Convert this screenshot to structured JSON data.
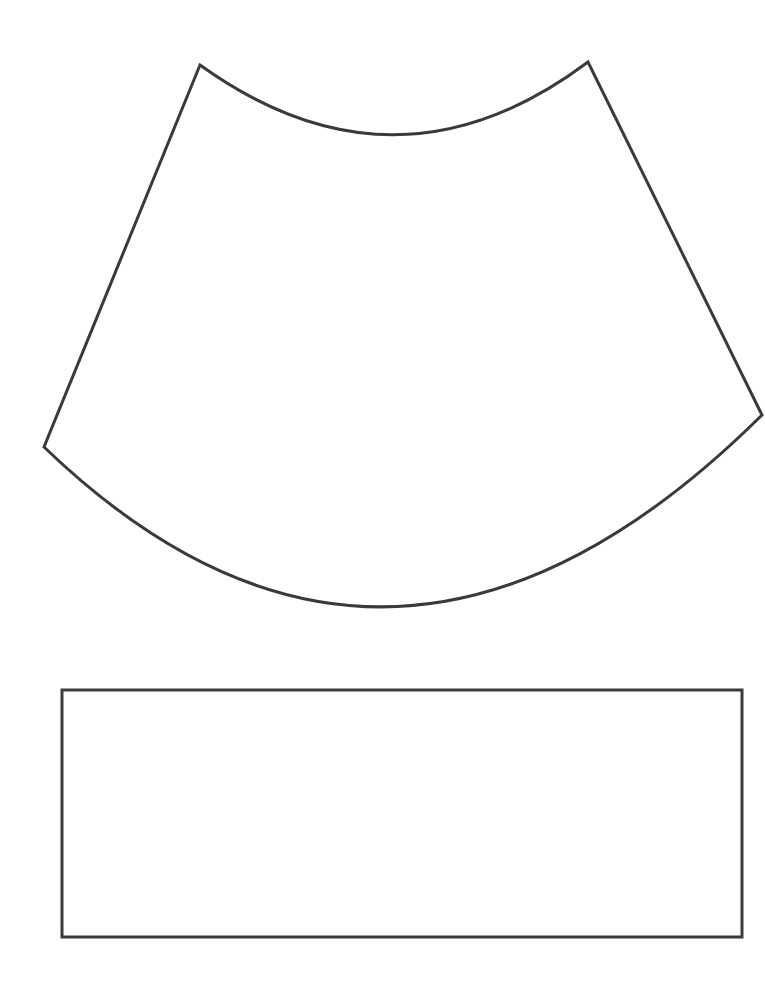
{
  "canvas": {
    "width": 765,
    "height": 982,
    "background_color": "#ffffff",
    "stroke_color": "#3a3a3a",
    "stroke_width": 3
  },
  "figure": {
    "title": "",
    "caption": "",
    "shape_count": 2
  },
  "shapes": [
    {
      "id": "annulus-sector",
      "name": "curved trapezoid (annulus sector)",
      "label": "",
      "fill_color": "#ffffff",
      "stroke_color": "#3a3a3a",
      "stroke_width": 3,
      "vertices": {
        "top_left_peak": [
          200,
          65
        ],
        "top_right_peak": [
          588,
          62
        ],
        "right_corner": [
          762,
          415
        ],
        "left_corner": [
          44,
          447
        ]
      },
      "top_arc": {
        "from": [
          200,
          65
        ],
        "to": [
          588,
          62
        ],
        "lowest_point": [
          395,
          150
        ],
        "bulge": "downward",
        "sagitta": 86
      },
      "bottom_arc": {
        "from": [
          44,
          447
        ],
        "to": [
          762,
          415
        ],
        "lowest_point": [
          385,
          645
        ],
        "bulge": "downward",
        "sagitta": 214
      },
      "path": "M 200 65 Q 396 206 588 62 L 762 415 Q 392 782 44 447 Z"
    },
    {
      "id": "rectangle",
      "name": "rectangle",
      "label": "",
      "fill_color": "#ffffff",
      "stroke_color": "#3a3a3a",
      "stroke_width": 3,
      "x": 62,
      "y": 690,
      "width": 680,
      "height": 247,
      "corners": {
        "top_left": [
          62,
          690
        ],
        "top_right": [
          742,
          690
        ],
        "bottom_right": [
          742,
          937
        ],
        "bottom_left": [
          62,
          937
        ]
      }
    }
  ],
  "annotations": [],
  "labels": []
}
